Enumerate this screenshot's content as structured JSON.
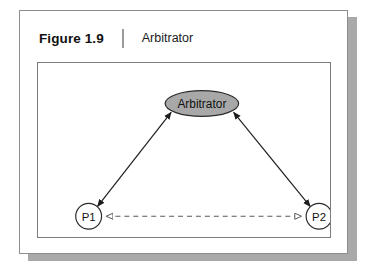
{
  "figure": {
    "label": "Figure 1.9",
    "caption": "Arbitrator",
    "divider": "vertical-rule"
  },
  "colors": {
    "card_border": "#8d8d8d",
    "card_shadow": "#a9a9a9",
    "diagram_border": "#7d7d7d",
    "node_fill_arbitrator": "#a8a8a8",
    "node_fill_peer": "#ffffff",
    "node_stroke": "#2b2b2b",
    "edge_solid": "#1d1d1d",
    "edge_dashed": "#5a5a5a",
    "text": "#111111"
  },
  "diagram": {
    "type": "node-link",
    "nodes": [
      {
        "id": "arbitrator",
        "label": "Arbitrator",
        "shape": "ellipse",
        "fill": "#a8a8a8",
        "cx": 165,
        "cy": 41,
        "rx": 37,
        "ry": 13
      },
      {
        "id": "p1",
        "label": "P1",
        "shape": "circle",
        "fill": "#ffffff",
        "cx": 51,
        "cy": 155,
        "r": 13
      },
      {
        "id": "p2",
        "label": "P2",
        "shape": "circle",
        "fill": "#ffffff",
        "cx": 283,
        "cy": 155,
        "r": 13
      }
    ],
    "edges": [
      {
        "id": "edge-p1-arbitrator",
        "from": "p1",
        "to": "arbitrator",
        "style": "solid",
        "arrowheads": "both",
        "arrowhead_style": "filled"
      },
      {
        "id": "edge-p2-arbitrator",
        "from": "p2",
        "to": "arbitrator",
        "style": "solid",
        "arrowheads": "both",
        "arrowhead_style": "filled"
      },
      {
        "id": "edge-p1-p2",
        "from": "p1",
        "to": "p2",
        "style": "dashed",
        "arrowheads": "both",
        "arrowhead_style": "hollow"
      }
    ]
  }
}
